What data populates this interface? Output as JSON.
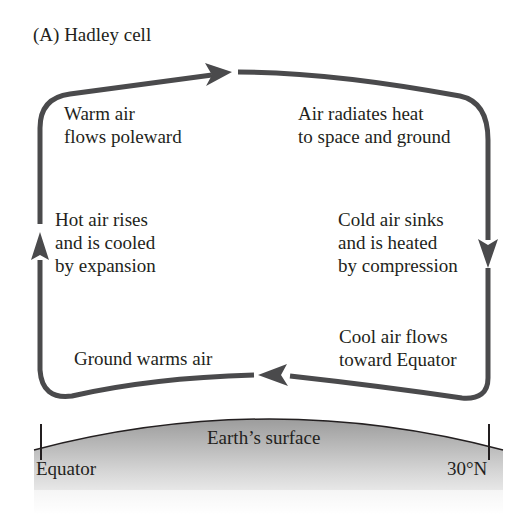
{
  "figure": {
    "title": "(A)  Hadley cell",
    "colors": {
      "arrow": "#4a4a4c",
      "text": "#231f20",
      "ground_top": "#9a9a9a",
      "ground_bottom": "#ffffff"
    }
  },
  "labels": {
    "top_left": "Warm air\nflows poleward",
    "top_right": "Air radiates heat\nto space and ground",
    "mid_left": "Hot air rises\nand is cooled\nby expansion",
    "mid_right": "Cold air sinks\nand is heated\nby compression",
    "bottom_left": "Ground warms air",
    "bottom_right": "Cool air flows\ntoward Equator"
  },
  "ground": {
    "surface_label": "Earth’s surface",
    "left_marker": "Equator",
    "right_marker": "30°N"
  }
}
